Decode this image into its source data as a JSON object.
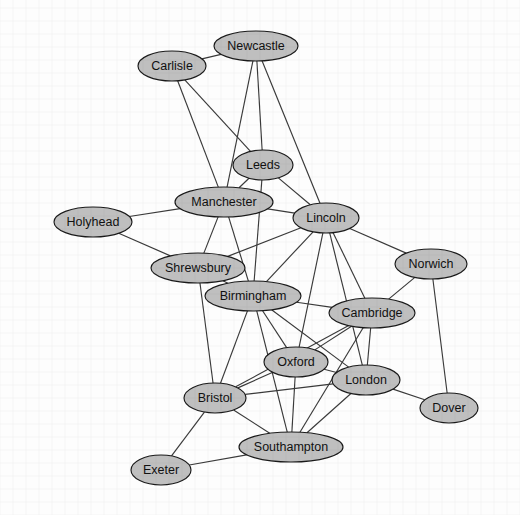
{
  "diagram": {
    "type": "undirected-node-link-graph",
    "background_color": "#fdfdfd",
    "node_fill_color": "#bfbfbf",
    "node_stroke_color": "#1a1a1a",
    "edge_color": "#3a3a3a",
    "label_color": "#111111",
    "width": 520,
    "height": 515
  },
  "nodes": [
    {
      "id": "carlisle",
      "label": "Carlisle",
      "cx": 172,
      "cy": 66,
      "rx": 34,
      "ry": 15
    },
    {
      "id": "newcastle",
      "label": "Newcastle",
      "cx": 256,
      "cy": 46,
      "rx": 42,
      "ry": 15
    },
    {
      "id": "leeds",
      "label": "Leeds",
      "cx": 263,
      "cy": 165,
      "rx": 30,
      "ry": 15
    },
    {
      "id": "manchester",
      "label": "Manchester",
      "cx": 224,
      "cy": 202,
      "rx": 49,
      "ry": 15
    },
    {
      "id": "lincoln",
      "label": "Lincoln",
      "cx": 326,
      "cy": 218,
      "rx": 33,
      "ry": 15
    },
    {
      "id": "holyhead",
      "label": "Holyhead",
      "cx": 93,
      "cy": 222,
      "rx": 39,
      "ry": 15
    },
    {
      "id": "shrewsbury",
      "label": "Shrewsbury",
      "cx": 198,
      "cy": 268,
      "rx": 47,
      "ry": 15
    },
    {
      "id": "norwich",
      "label": "Norwich",
      "cx": 431,
      "cy": 264,
      "rx": 36,
      "ry": 15
    },
    {
      "id": "birmingham",
      "label": "Birmingham",
      "cx": 253,
      "cy": 296,
      "rx": 48,
      "ry": 15
    },
    {
      "id": "cambridge",
      "label": "Cambridge",
      "cx": 372,
      "cy": 313,
      "rx": 43,
      "ry": 15
    },
    {
      "id": "oxford",
      "label": "Oxford",
      "cx": 296,
      "cy": 362,
      "rx": 32,
      "ry": 15
    },
    {
      "id": "london",
      "label": "London",
      "cx": 366,
      "cy": 380,
      "rx": 34,
      "ry": 15
    },
    {
      "id": "bristol",
      "label": "Bristol",
      "cx": 215,
      "cy": 398,
      "rx": 31,
      "ry": 15
    },
    {
      "id": "dover",
      "label": "Dover",
      "cx": 449,
      "cy": 408,
      "rx": 29,
      "ry": 15
    },
    {
      "id": "southampton",
      "label": "Southampton",
      "cx": 291,
      "cy": 447,
      "rx": 52,
      "ry": 15
    },
    {
      "id": "exeter",
      "label": "Exeter",
      "cx": 161,
      "cy": 470,
      "rx": 30,
      "ry": 15
    }
  ],
  "edges": [
    {
      "source": "carlisle",
      "target": "newcastle"
    },
    {
      "source": "carlisle",
      "target": "leeds"
    },
    {
      "source": "carlisle",
      "target": "manchester"
    },
    {
      "source": "newcastle",
      "target": "leeds"
    },
    {
      "source": "newcastle",
      "target": "manchester"
    },
    {
      "source": "newcastle",
      "target": "lincoln"
    },
    {
      "source": "leeds",
      "target": "manchester"
    },
    {
      "source": "leeds",
      "target": "lincoln"
    },
    {
      "source": "leeds",
      "target": "birmingham"
    },
    {
      "source": "manchester",
      "target": "lincoln"
    },
    {
      "source": "manchester",
      "target": "holyhead"
    },
    {
      "source": "manchester",
      "target": "shrewsbury"
    },
    {
      "source": "manchester",
      "target": "birmingham"
    },
    {
      "source": "holyhead",
      "target": "shrewsbury"
    },
    {
      "source": "shrewsbury",
      "target": "birmingham"
    },
    {
      "source": "shrewsbury",
      "target": "bristol"
    },
    {
      "source": "shrewsbury",
      "target": "lincoln"
    },
    {
      "source": "lincoln",
      "target": "norwich"
    },
    {
      "source": "lincoln",
      "target": "cambridge"
    },
    {
      "source": "lincoln",
      "target": "birmingham"
    },
    {
      "source": "lincoln",
      "target": "london"
    },
    {
      "source": "lincoln",
      "target": "oxford"
    },
    {
      "source": "norwich",
      "target": "cambridge"
    },
    {
      "source": "norwich",
      "target": "dover"
    },
    {
      "source": "birmingham",
      "target": "cambridge"
    },
    {
      "source": "birmingham",
      "target": "oxford"
    },
    {
      "source": "birmingham",
      "target": "london"
    },
    {
      "source": "birmingham",
      "target": "bristol"
    },
    {
      "source": "birmingham",
      "target": "southampton"
    },
    {
      "source": "cambridge",
      "target": "london"
    },
    {
      "source": "cambridge",
      "target": "oxford"
    },
    {
      "source": "cambridge",
      "target": "southampton"
    },
    {
      "source": "cambridge",
      "target": "bristol"
    },
    {
      "source": "oxford",
      "target": "london"
    },
    {
      "source": "oxford",
      "target": "bristol"
    },
    {
      "source": "oxford",
      "target": "southampton"
    },
    {
      "source": "london",
      "target": "dover"
    },
    {
      "source": "london",
      "target": "southampton"
    },
    {
      "source": "london",
      "target": "bristol"
    },
    {
      "source": "bristol",
      "target": "southampton"
    },
    {
      "source": "bristol",
      "target": "exeter"
    },
    {
      "source": "southampton",
      "target": "exeter"
    }
  ]
}
